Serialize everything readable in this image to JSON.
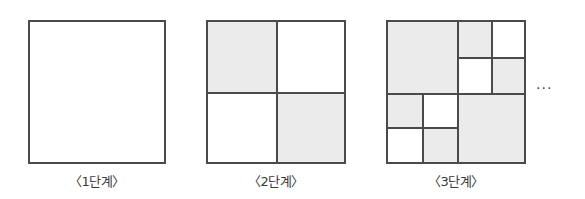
{
  "diagram": {
    "stages": [
      {
        "label": "〈1단계〉"
      },
      {
        "label": "〈2단계〉"
      },
      {
        "label": "〈3단계〉"
      }
    ],
    "continuation": "···",
    "colors": {
      "border": "#4a4a4a",
      "shaded": "#ebebeb",
      "white": "#ffffff"
    }
  }
}
